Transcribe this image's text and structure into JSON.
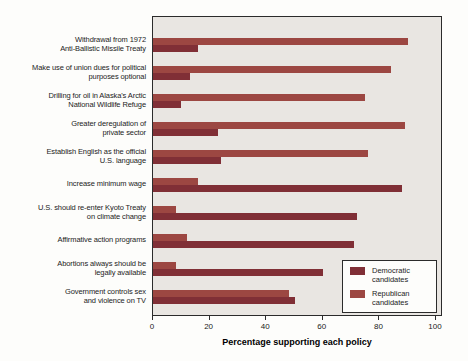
{
  "chart_data": {
    "type": "bar",
    "orientation": "horizontal",
    "title": "",
    "xlabel": "Percentage supporting each policy",
    "ylabel": "",
    "xlim": [
      0,
      100
    ],
    "xticks": [
      0,
      20,
      40,
      60,
      80,
      100
    ],
    "grid": false,
    "plot_background": "#e9e6e2",
    "categories": [
      "Withdrawal from 1972 Anti-Ballistic Missile Treaty",
      "Make use of union dues for political purposes optional",
      "Drilling for oil in Alaska's Arctic National Wildlife Refuge",
      "Greater deregulation of private sector",
      "Establish English as the official U.S. language",
      "Increase minimum wage",
      "U.S. should re-enter Kyoto Treaty on climate change",
      "Affirmative action programs",
      "Abortions always should be legally available",
      "Government controls sex and violence on TV"
    ],
    "category_label_lines": [
      [
        "Withdrawal from 1972",
        "Anti-Ballistic Missile Treaty"
      ],
      [
        "Make use of union dues for political",
        "purposes optional"
      ],
      [
        "Drilling for oil in Alaska's Arctic",
        "National Wildlife Refuge"
      ],
      [
        "Greater deregulation of",
        "private sector"
      ],
      [
        "Establish English as the official",
        "U.S. language"
      ],
      [
        "Increase minimum wage"
      ],
      [
        "U.S. should re-enter Kyoto Treaty",
        "on climate change"
      ],
      [
        "Affirmative action programs"
      ],
      [
        "Abortions always should be",
        "legally available"
      ],
      [
        "Government controls sex",
        "and violence on TV"
      ]
    ],
    "series": [
      {
        "name": "Republican candidates",
        "color": "#9c4742",
        "values": [
          90,
          84,
          75,
          89,
          76,
          16,
          8,
          12,
          8,
          48
        ]
      },
      {
        "name": "Democratic candidates",
        "color": "#802f36",
        "values": [
          16,
          13,
          10,
          23,
          24,
          88,
          72,
          71,
          60,
          50
        ]
      }
    ],
    "bar_order_top_to_bottom": [
      "Republican candidates",
      "Democratic candidates"
    ],
    "legend": {
      "position": "inside-bottom-right",
      "entries": [
        "Democratic candidates",
        "Republican candidates"
      ]
    }
  }
}
